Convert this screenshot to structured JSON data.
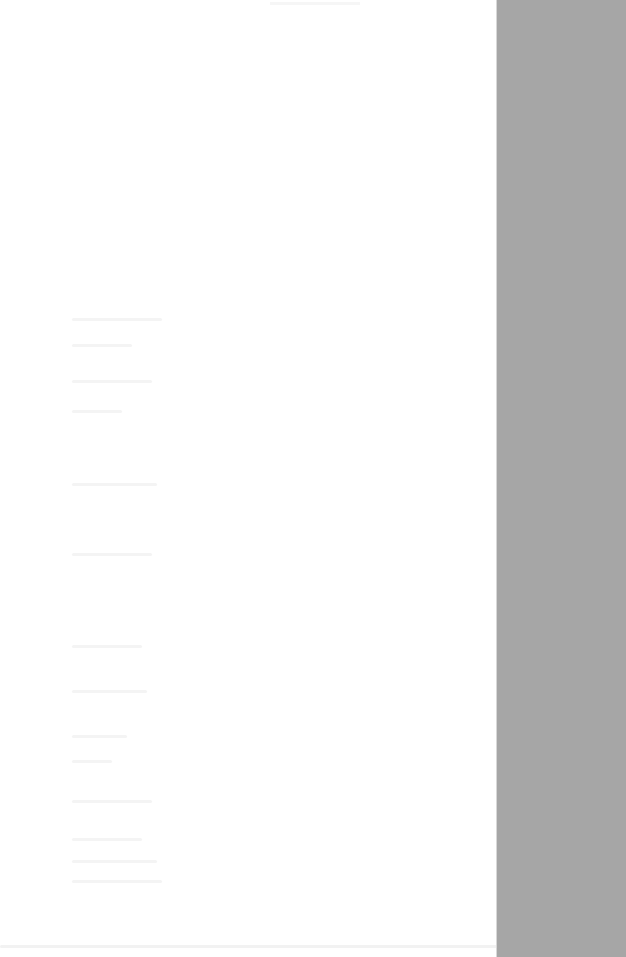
{
  "panel": {
    "background": "#ffffff",
    "width_px": 497,
    "content_state": "faded / illegible"
  },
  "backdrop": {
    "color": "#a6a6a6"
  },
  "ghost_lines_y": [
    318,
    344,
    380,
    410,
    483,
    553,
    645,
    690,
    735,
    760,
    800,
    838,
    860,
    880
  ]
}
